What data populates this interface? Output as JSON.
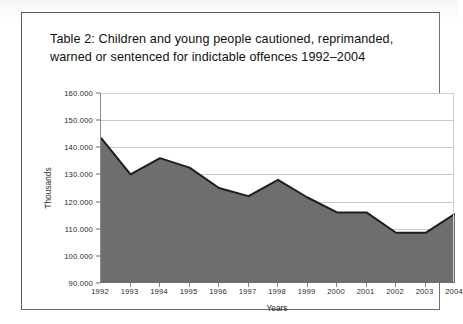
{
  "document": {
    "caption_lines": [
      "Table 2:  Children and young people cautioned, reprimanded,",
      "warned or sentenced for indictable offences 1992–2004"
    ]
  },
  "chart_data": {
    "type": "area",
    "title": "",
    "xlabel": "Years",
    "ylabel": "Thousands",
    "categories": [
      "1992",
      "1993",
      "1994",
      "1995",
      "1996",
      "1997",
      "1998",
      "1999",
      "2000",
      "2001",
      "2002",
      "2003",
      "2004"
    ],
    "values": [
      143500,
      130000,
      136000,
      132500,
      125000,
      122000,
      128000,
      121500,
      116000,
      116000,
      108500,
      108500,
      115500
    ],
    "tick_labels_y": [
      "160.000",
      "150.000",
      "140.000",
      "130.000",
      "120.000",
      "110.000",
      "100.000",
      "90.000"
    ],
    "tick_values_y": [
      160000,
      150000,
      140000,
      130000,
      120000,
      110000,
      100000,
      90000
    ],
    "ylim": [
      90000,
      160000
    ],
    "grid": true,
    "legend": "none",
    "series_color": "#6e6e6e",
    "series_border_color": "#1e1e1e",
    "grid_color": "#c9c9c9"
  }
}
